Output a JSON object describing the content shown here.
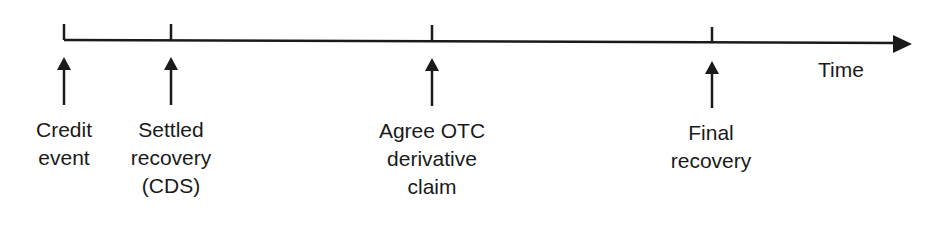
{
  "diagram": {
    "type": "timeline",
    "axis_label": "Time",
    "colors": {
      "line": "#1a1a1a",
      "background": "#ffffff"
    },
    "events": [
      {
        "id": "credit-event",
        "x": 64,
        "lines": [
          "Credit",
          "event"
        ]
      },
      {
        "id": "settled-recovery",
        "x": 171,
        "lines": [
          "Settled",
          "recovery",
          "(CDS)"
        ]
      },
      {
        "id": "agree-otc-claim",
        "x": 432,
        "lines": [
          "Agree OTC",
          "derivative",
          "claim"
        ]
      },
      {
        "id": "final-recovery",
        "x": 712,
        "lines": [
          "Final",
          "recovery"
        ]
      }
    ]
  }
}
